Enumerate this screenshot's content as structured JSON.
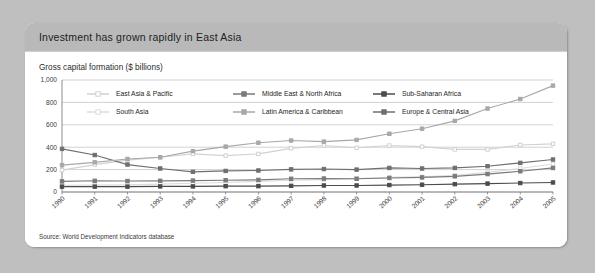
{
  "card": {
    "title": "Investment has grown rapidly in East Asia",
    "axis_title": "Gross capital formation ($ billions)",
    "source": "Source: World Development Indicators database"
  },
  "chart_data": {
    "type": "line",
    "title": "Investment has grown rapidly in East Asia",
    "subtitle": "Gross capital formation ($ billions)",
    "xlabel": "",
    "ylabel": "Gross capital formation ($ billions)",
    "ylim": [
      0,
      1000
    ],
    "yticks": [
      0,
      200,
      400,
      600,
      800,
      1000
    ],
    "ytick_labels": [
      "0",
      "200",
      "400",
      "600",
      "800",
      "1,000"
    ],
    "grid": "horizontal",
    "legend_position": "top-inside",
    "categories": [
      "1990",
      "1991",
      "1992",
      "1993",
      "1994",
      "1995",
      "1996",
      "1997",
      "1998",
      "1999",
      "2000",
      "2001",
      "2002",
      "2003",
      "2004",
      "2005"
    ],
    "series": [
      {
        "name": "East Asia & Pacific",
        "color": "#d2d2d2",
        "marker": "square-open",
        "values": [
          195,
          245,
          285,
          310,
          340,
          325,
          340,
          390,
          415,
          395,
          415,
          405,
          380,
          380,
          420,
          430
        ]
      },
      {
        "name": "South Asia",
        "color": "#dcdcdc",
        "marker": "square-open",
        "values": [
          60,
          62,
          63,
          70,
          78,
          85,
          95,
          105,
          110,
          120,
          130,
          135,
          150,
          175,
          210,
          250
        ]
      },
      {
        "name": "Middle East & North Africa",
        "color": "#7a7a7a",
        "marker": "square-filled",
        "values": [
          95,
          100,
          98,
          100,
          102,
          105,
          108,
          118,
          120,
          118,
          125,
          130,
          140,
          160,
          185,
          215
        ]
      },
      {
        "name": "Latin America & Caribbean",
        "color": "#a8a8a8",
        "marker": "square-filled",
        "values": [
          240,
          265,
          295,
          310,
          365,
          405,
          440,
          460,
          450,
          465,
          520,
          565,
          635,
          745,
          830,
          950
        ]
      },
      {
        "name": "Sub-Saharan Africa",
        "color": "#4b4b4b",
        "marker": "square-filled",
        "values": [
          48,
          48,
          48,
          50,
          50,
          52,
          52,
          55,
          58,
          58,
          62,
          65,
          70,
          75,
          80,
          85
        ]
      },
      {
        "name": "Europe & Central Asia",
        "color": "#6f6f6f",
        "marker": "square-filled",
        "values": [
          385,
          330,
          245,
          210,
          180,
          188,
          192,
          202,
          205,
          200,
          215,
          210,
          215,
          230,
          260,
          290
        ]
      }
    ],
    "legend": [
      {
        "label": "East Asia & Pacific",
        "color": "#d2d2d2",
        "marker": "square-open"
      },
      {
        "label": "Middle East & North Africa",
        "color": "#7a7a7a",
        "marker": "square-filled"
      },
      {
        "label": "Sub-Saharan Africa",
        "color": "#4b4b4b",
        "marker": "square-filled"
      },
      {
        "label": "South Asia",
        "color": "#dcdcdc",
        "marker": "square-open"
      },
      {
        "label": "Latin America & Caribbean",
        "color": "#a8a8a8",
        "marker": "square-filled"
      },
      {
        "label": "Europe & Central Asia",
        "color": "#6f6f6f",
        "marker": "square-filled"
      }
    ]
  },
  "colors": {
    "page_background": "#bfbfbf",
    "card_background": "#ffffff",
    "header_background": "#b9b9b9",
    "gridline": "#b4b4b4",
    "axis": "#6e6e6e"
  }
}
